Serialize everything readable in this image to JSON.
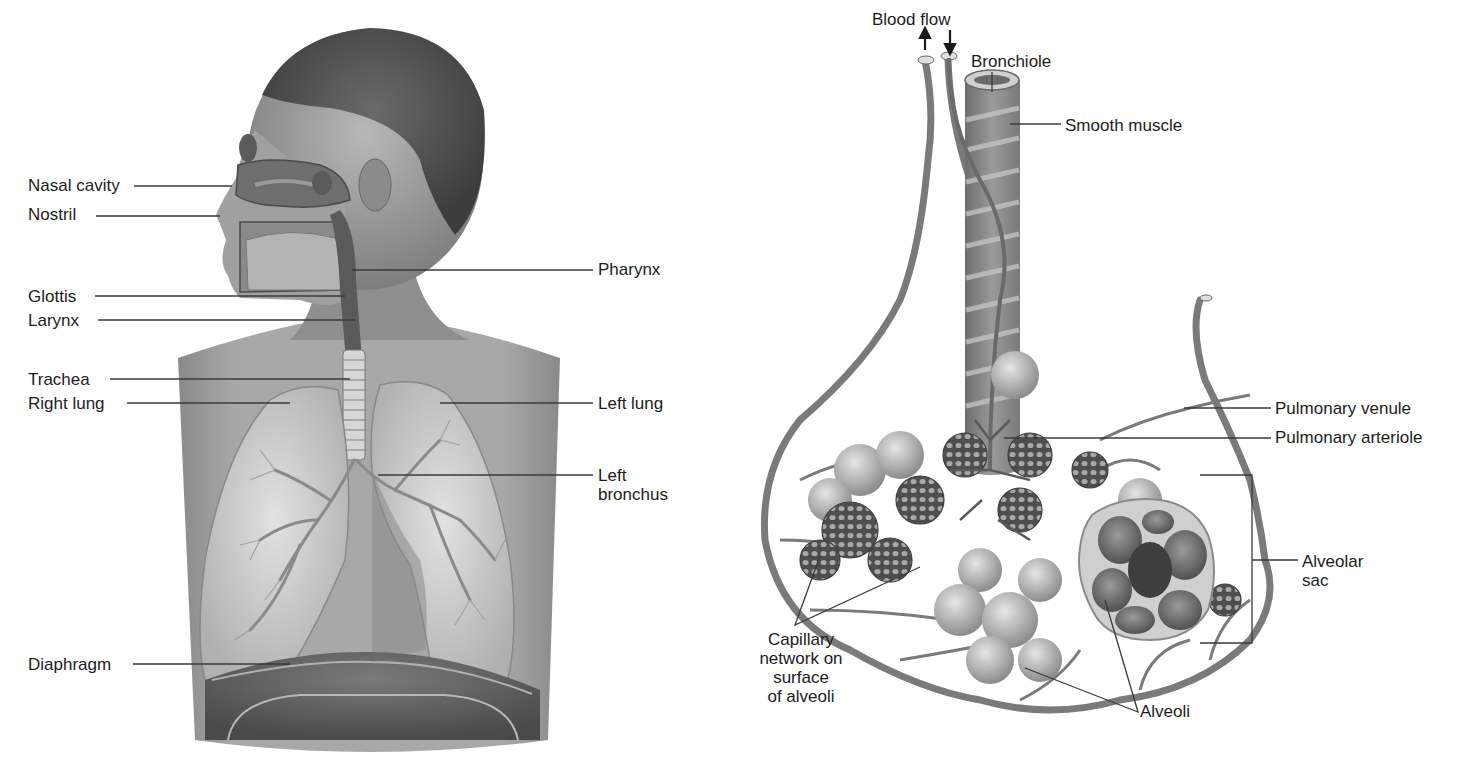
{
  "figure": {
    "left_panel": {
      "name": "Human respiratory system",
      "labels": [
        {
          "id": "nasal-cavity",
          "text": "Nasal cavity",
          "x": 28,
          "y": 176,
          "side": "left",
          "line": [
            [
              134,
              186
            ],
            [
              232,
              186
            ]
          ]
        },
        {
          "id": "nostril",
          "text": "Nostril",
          "x": 28,
          "y": 205,
          "side": "left",
          "line": [
            [
              96,
              216
            ],
            [
              220,
              216
            ]
          ]
        },
        {
          "id": "glottis",
          "text": "Glottis",
          "x": 28,
          "y": 287,
          "side": "left",
          "line": [
            [
              95,
              296
            ],
            [
              345,
              296
            ]
          ]
        },
        {
          "id": "larynx",
          "text": "Larynx",
          "x": 28,
          "y": 311,
          "side": "left",
          "line": [
            [
              98,
              320
            ],
            [
              355,
              320
            ]
          ]
        },
        {
          "id": "trachea",
          "text": "Trachea",
          "x": 28,
          "y": 370,
          "side": "left",
          "line": [
            [
              110,
              379
            ],
            [
              350,
              379
            ]
          ]
        },
        {
          "id": "right-lung",
          "text": "Right lung",
          "x": 28,
          "y": 394,
          "side": "left",
          "line": [
            [
              127,
              403
            ],
            [
              290,
              403
            ]
          ]
        },
        {
          "id": "diaphragm",
          "text": "Diaphragm",
          "x": 28,
          "y": 655,
          "side": "left",
          "line": [
            [
              133,
              664
            ],
            [
              290,
              664
            ]
          ]
        },
        {
          "id": "pharynx",
          "text": "Pharynx",
          "x": 598,
          "y": 260,
          "side": "right",
          "line": [
            [
              352,
              270
            ],
            [
              593,
              270
            ]
          ]
        },
        {
          "id": "left-lung",
          "text": "Left lung",
          "x": 598,
          "y": 394,
          "side": "right",
          "line": [
            [
              440,
              403
            ],
            [
              593,
              403
            ]
          ]
        },
        {
          "id": "left-bronchus",
          "text": "Left\nbronchus",
          "x": 598,
          "y": 466,
          "side": "right",
          "line": [
            [
              378,
              475
            ],
            [
              593,
              475
            ]
          ]
        }
      ]
    },
    "right_panel": {
      "name": "Bronchiole and alveoli detail",
      "labels": [
        {
          "id": "blood-flow",
          "text": "Blood flow",
          "x": 152,
          "y": 30,
          "side": "top"
        },
        {
          "id": "bronchiole",
          "text": "Bronchiole",
          "x": 251,
          "y": 52,
          "side": "top",
          "line": [
            [
              272,
              72
            ],
            [
              272,
              92
            ]
          ]
        },
        {
          "id": "smooth-muscle",
          "text": "Smooth muscle",
          "x": 345,
          "y": 116,
          "side": "right",
          "line": [
            [
              290,
              124
            ],
            [
              341,
              124
            ]
          ]
        },
        {
          "id": "pulmonary-venule",
          "text": "Pulmonary venule",
          "x": 555,
          "y": 399,
          "side": "right",
          "line": [
            [
              464,
              408
            ],
            [
              551,
              408
            ]
          ]
        },
        {
          "id": "pulmonary-arteriole",
          "text": "Pulmonary arteriole",
          "x": 555,
          "y": 428,
          "side": "right",
          "line": [
            [
              284,
              438
            ],
            [
              551,
              438
            ]
          ]
        },
        {
          "id": "alveolar-sac",
          "text": "Alveolar\nsac",
          "x": 582,
          "y": 552,
          "side": "right"
        },
        {
          "id": "capillary-network",
          "text": "Capillary\nnetwork on\nsurface\nof alveoli",
          "x": 6,
          "y": 636,
          "side": "bottom-left"
        },
        {
          "id": "alveoli",
          "text": "Alveoli",
          "x": 422,
          "y": 700,
          "side": "bottom"
        }
      ]
    }
  },
  "colors": {
    "background": "#ffffff",
    "label_text": "#1c1c1c",
    "leader_line": "#3a3a3a",
    "skin": "#9a9a9a",
    "lung": "#c8c8c8",
    "vessel": "#7a7a7a",
    "dark_tissue": "#555555"
  }
}
